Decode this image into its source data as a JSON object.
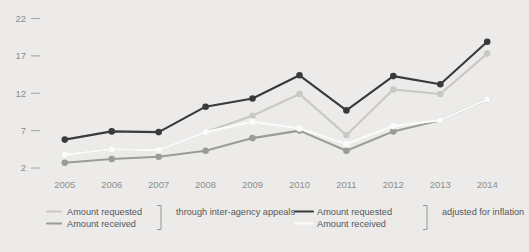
{
  "chart_data": {
    "type": "line",
    "title": "",
    "xlabel": "",
    "ylabel": "",
    "x": [
      2005,
      2006,
      2007,
      2008,
      2009,
      2010,
      2011,
      2012,
      2013,
      2014
    ],
    "categories": [
      "2005",
      "2006",
      "2007",
      "2008",
      "2009",
      "2010",
      "2011",
      "2012",
      "2013",
      "2014"
    ],
    "ytick_labels": [
      "2",
      "7",
      "12",
      "17",
      "22"
    ],
    "ytick_values": [
      2,
      7,
      12,
      17,
      22
    ],
    "ylim": [
      1.2,
      22.6
    ],
    "xlim": [
      2004.6,
      2014.4
    ],
    "grid": false,
    "legend_position": "bottom",
    "series": [
      {
        "name": "Amount requested",
        "group": "adjusted for inflation",
        "color": "#3a3a3a",
        "values": [
          5.8,
          6.9,
          6.8,
          10.2,
          11.3,
          14.4,
          9.7,
          14.3,
          13.2,
          18.9
        ]
      },
      {
        "name": "Amount received",
        "group": "adjusted for inflation",
        "color": "#c9c8c6",
        "values": [
          3.8,
          4.5,
          4.4,
          6.8,
          9.0,
          11.9,
          6.4,
          12.5,
          11.9,
          17.3
        ]
      },
      {
        "name": "Amount requested",
        "group": "through inter-agency appeals",
        "color": "#fbfbfa",
        "values": [
          3.8,
          4.5,
          4.4,
          6.8,
          8.2,
          7.3,
          5.2,
          7.6,
          8.4,
          11.2
        ]
      },
      {
        "name": "Amount received",
        "group": "through inter-agency appeals",
        "color": "#9b9b99",
        "values": [
          2.7,
          3.2,
          3.5,
          4.3,
          6.0,
          7.0,
          4.3,
          6.9,
          8.4,
          11.2
        ]
      }
    ]
  },
  "legend": {
    "groups": [
      {
        "bracket_label": "through inter-agency appeals",
        "entries": [
          {
            "label": "Amount requested",
            "color": "#c9c8c6"
          },
          {
            "label": "Amount received",
            "color": "#9b9b99"
          }
        ]
      },
      {
        "bracket_label": "adjusted for inflation",
        "entries": [
          {
            "label": "Amount requested",
            "color": "#3a3a3a"
          },
          {
            "label": "Amount received",
            "color": "#fbfbfa"
          }
        ]
      }
    ]
  }
}
